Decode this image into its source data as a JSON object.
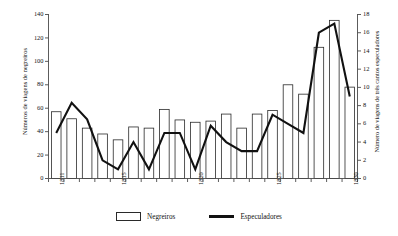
{
  "chart_data": {
    "type": "bar",
    "title": "",
    "subtitle": "",
    "xlabel": "",
    "ylabel": "Números de viagens de negreiros",
    "y2label": "Número de viagens de três cantos especuladores",
    "grid": false,
    "legend_position": "bottom-center",
    "categories": [
      "1811",
      "1812",
      "1813",
      "1814",
      "1815",
      "1816",
      "1817",
      "1818",
      "1819",
      "1820",
      "1821",
      "1822",
      "1823",
      "1824",
      "1825",
      "1826",
      "1827",
      "1828",
      "1829",
      "1830"
    ],
    "xtick_labels": [
      "1811",
      "1815",
      "1820",
      "1825",
      "1830"
    ],
    "xtick_categories": [
      "1811",
      "1815",
      "1820",
      "1825",
      "1830"
    ],
    "ylim": [
      0,
      140
    ],
    "yticks": [
      0,
      20,
      40,
      60,
      80,
      100,
      120,
      140
    ],
    "ytick_labels": [
      "0",
      "20",
      "40",
      "60",
      "80",
      "100",
      "120",
      "140"
    ],
    "y2lim": [
      0,
      18
    ],
    "y2ticks": [
      0,
      2,
      4,
      6,
      8,
      10,
      12,
      14,
      16,
      18
    ],
    "y2tick_labels": [
      "0",
      "2",
      "4",
      "6",
      "8",
      "10",
      "12",
      "14",
      "16",
      "18"
    ],
    "series": [
      {
        "name": "Negreiros",
        "kind": "bar",
        "axis": "left",
        "color": "#ffffff",
        "edge_color": "#2a2a2a",
        "values": [
          57,
          51,
          43,
          38,
          33,
          44,
          43,
          59,
          50,
          48,
          49,
          55,
          43,
          55,
          58,
          80,
          72,
          112,
          135,
          78
        ]
      },
      {
        "name": "Especuladores",
        "kind": "line",
        "axis": "right",
        "color": "#111111",
        "values": [
          5.0,
          8.3,
          6.5,
          2.0,
          1.0,
          4.0,
          1.0,
          5.0,
          5.0,
          1.0,
          5.8,
          4.0,
          3.0,
          3.0,
          7.0,
          6.0,
          5.0,
          16.0,
          17.0,
          9.0
        ]
      }
    ]
  },
  "legend": {
    "items": [
      {
        "label": "Negreiros",
        "marker": "bar-swatch"
      },
      {
        "label": "Especuladores",
        "marker": "line-swatch"
      }
    ]
  },
  "axes": {
    "left_title": "Números de viagens de negreiros",
    "right_title": "Número de viagens de três cantos especuladores"
  }
}
